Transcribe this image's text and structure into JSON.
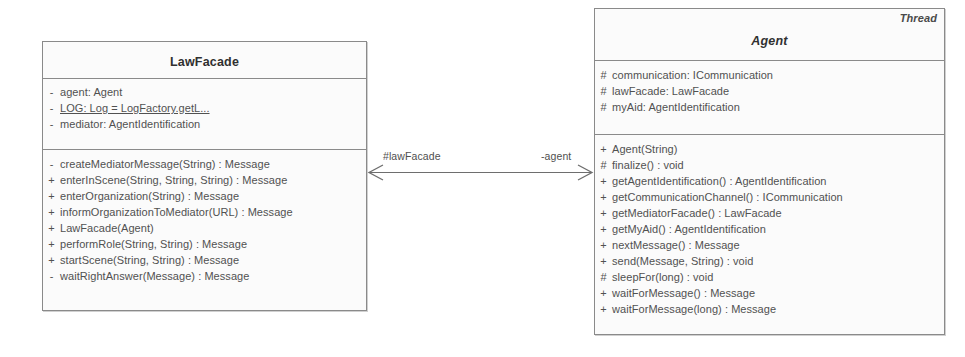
{
  "diagram": {
    "type": "uml-class-diagram",
    "classes": [
      {
        "id": "lawfacade",
        "name": "LawFacade",
        "stereotype": "",
        "abstract": false,
        "attributes": [
          {
            "visibility": "-",
            "text": "agent: Agent",
            "static": false
          },
          {
            "visibility": "-",
            "text": "LOG: Log = LogFactory.getL...",
            "static": true
          },
          {
            "visibility": "-",
            "text": "mediator: AgentIdentification",
            "static": false
          }
        ],
        "operations": [
          {
            "visibility": "-",
            "text": "createMediatorMessage(String) : Message"
          },
          {
            "visibility": "+",
            "text": "enterInScene(String, String, String) : Message"
          },
          {
            "visibility": "+",
            "text": "enterOrganization(String) : Message"
          },
          {
            "visibility": "+",
            "text": "informOrganizationToMediator(URL) : Message"
          },
          {
            "visibility": "+",
            "text": "LawFacade(Agent)"
          },
          {
            "visibility": "+",
            "text": "performRole(String, String) : Message"
          },
          {
            "visibility": "+",
            "text": "startScene(String, String) : Message"
          },
          {
            "visibility": "-",
            "text": "waitRightAnswer(Message) : Message"
          }
        ]
      },
      {
        "id": "agent",
        "name": "Agent",
        "stereotype": "Thread",
        "abstract": true,
        "attributes": [
          {
            "visibility": "#",
            "text": "communication: ICommunication",
            "static": false
          },
          {
            "visibility": "#",
            "text": "lawFacade: LawFacade",
            "static": false
          },
          {
            "visibility": "#",
            "text": "myAid: AgentIdentification",
            "static": false
          }
        ],
        "operations": [
          {
            "visibility": "+",
            "text": "Agent(String)"
          },
          {
            "visibility": "#",
            "text": "finalize() : void"
          },
          {
            "visibility": "+",
            "text": "getAgentIdentification() : AgentIdentification"
          },
          {
            "visibility": "+",
            "text": "getCommunicationChannel() : ICommunication"
          },
          {
            "visibility": "+",
            "text": "getMediatorFacade() : LawFacade"
          },
          {
            "visibility": "+",
            "text": "getMyAid() : AgentIdentification"
          },
          {
            "visibility": "+",
            "text": "nextMessage() : Message"
          },
          {
            "visibility": "+",
            "text": "send(Message, String) : void"
          },
          {
            "visibility": "#",
            "text": "sleepFor(long) : void"
          },
          {
            "visibility": "+",
            "text": "waitForMessage() : Message"
          },
          {
            "visibility": "+",
            "text": "waitForMessage(long) : Message"
          }
        ]
      }
    ],
    "association": {
      "source_role": "#lawFacade",
      "target_role": "-agent",
      "navigable_both": true
    },
    "colors": {
      "border": "#8a8a8a",
      "fill": "#fbfbfb",
      "text": "#515151",
      "line": "#6e6e6e"
    }
  }
}
